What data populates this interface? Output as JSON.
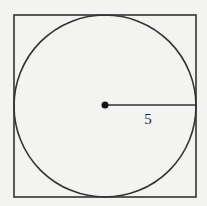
{
  "diagram": {
    "shapes": {
      "square": {
        "x": 14,
        "y": 15,
        "size": 182,
        "stroke": "#333333"
      },
      "circle": {
        "cx": 105,
        "cy": 106,
        "r": 91,
        "stroke": "#333333"
      },
      "center_point": {
        "cx": 105,
        "cy": 105,
        "r": 3.5,
        "fill": "#111111"
      },
      "radius_segment": {
        "x1": 105,
        "y1": 105,
        "x2": 196,
        "y2": 105
      }
    },
    "labels": {
      "radius_value": "5"
    }
  }
}
